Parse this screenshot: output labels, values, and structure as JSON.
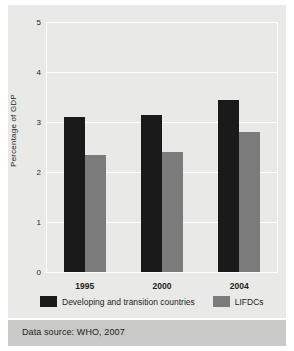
{
  "chart_data": {
    "type": "bar",
    "title": "",
    "xlabel": "",
    "ylabel": "Percentage of GDP",
    "categories": [
      "1995",
      "2000",
      "2004"
    ],
    "series": [
      {
        "name": "Developing and transition countries",
        "color": "#1a1a1a",
        "values": [
          3.1,
          3.15,
          3.45
        ]
      },
      {
        "name": "LIFDCs",
        "color": "#7b7b7b",
        "values": [
          2.35,
          2.4,
          2.8
        ]
      }
    ],
    "ylim": [
      0,
      5
    ],
    "yticks": [
      "0",
      "1",
      "2",
      "3",
      "4",
      "5"
    ],
    "ytick_values": [
      0,
      1,
      2,
      3,
      4,
      5
    ],
    "grid": true,
    "grid_color": "#ffffff",
    "legend_position": "bottom",
    "background": "#e9e9e7"
  },
  "footer": {
    "source": "Data source: WHO, 2007",
    "band_color": "#c9c9c7"
  }
}
